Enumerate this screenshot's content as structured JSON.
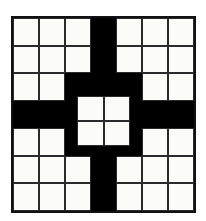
{
  "figure": {
    "colors": {
      "white_cell": "#fbfbf8",
      "black_cell": "#000000",
      "grid_line": "#2a2a2a",
      "background": "#ffffff"
    }
  },
  "chart_data": {
    "type": "heatmap",
    "xlabel": "",
    "ylabel": "",
    "rows": 7,
    "columns": 7,
    "legend": [
      {
        "value": 0,
        "label": "white",
        "color": "#fbfbf8"
      },
      {
        "value": 1,
        "label": "black",
        "color": "#000000"
      }
    ],
    "categories": [
      "C1",
      "C2",
      "C3",
      "C4",
      "C5",
      "C6",
      "C7"
    ],
    "row_labels": [
      "R1",
      "R2",
      "R3",
      "R4",
      "R5",
      "R6",
      "R7"
    ],
    "values": [
      [
        0,
        0,
        0,
        1,
        0,
        0,
        0
      ],
      [
        0,
        0,
        0,
        1,
        0,
        0,
        0
      ],
      [
        0,
        0,
        1,
        1,
        1,
        0,
        0
      ],
      [
        1,
        1,
        1,
        1,
        1,
        1,
        1
      ],
      [
        0,
        0,
        1,
        1,
        1,
        0,
        0
      ],
      [
        0,
        0,
        0,
        1,
        0,
        0,
        0
      ],
      [
        0,
        0,
        0,
        1,
        0,
        0,
        0
      ]
    ],
    "overlay": {
      "name": "center-block",
      "type": "white-square-group",
      "rows": 2,
      "columns": 2,
      "values": [
        [
          0,
          0
        ],
        [
          0,
          0
        ]
      ]
    },
    "white_cell_count": 36,
    "black_cell_count": 13,
    "symmetry": "4-fold (horizontal, vertical and diagonal mirror)"
  }
}
